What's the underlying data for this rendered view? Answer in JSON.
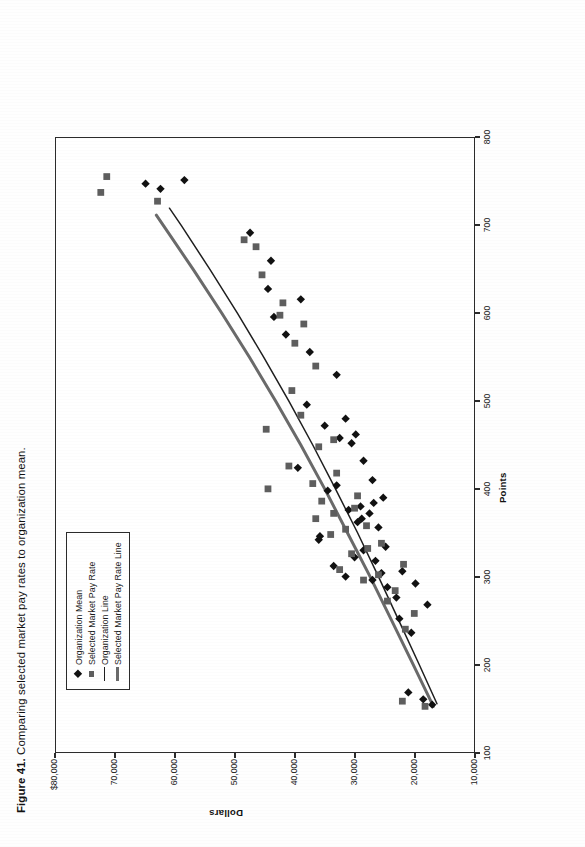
{
  "caption": {
    "figure_number": "Figure 41.",
    "text": "Comparing selected market pay rates to organization mean."
  },
  "legend": {
    "items": [
      {
        "label": "Organization Mean",
        "key": "diamond-marker",
        "color": "#111111"
      },
      {
        "label": "Selected Market Pay Rate",
        "key": "square-marker",
        "color": "#5e5e5e"
      },
      {
        "label": "Organization Line",
        "key": "thin-line",
        "color": "#1f1f1f"
      },
      {
        "label": "Selected Market Pay Rate Line",
        "key": "thick-line",
        "color": "#6a6a6a"
      }
    ]
  },
  "axes": {
    "x_label": "Points",
    "y_label": "Dollars",
    "x_ticks": [
      "100",
      "200",
      "300",
      "400",
      "500",
      "600",
      "700",
      "800"
    ],
    "y_ticks": [
      "$80,000",
      "70,000",
      "60,000",
      "50,000",
      "40,000",
      "30,000",
      "20,000",
      "10,000"
    ]
  },
  "chart_data": {
    "type": "scatter",
    "title": "Comparing selected market pay rates to organization mean.",
    "xlabel": "Points",
    "ylabel": "Dollars",
    "xlim": [
      100,
      800
    ],
    "ylim": [
      10000,
      80000
    ],
    "xticks": [
      100,
      200,
      300,
      400,
      500,
      600,
      700,
      800
    ],
    "yticks": [
      10000,
      20000,
      30000,
      40000,
      50000,
      60000,
      70000,
      80000
    ],
    "grid": false,
    "legend_position": "upper-left",
    "series": [
      {
        "name": "Organization Mean",
        "marker": "diamond",
        "color": "#111111",
        "points": [
          [
            154,
            17000
          ],
          [
            160,
            18500
          ],
          [
            168,
            21000
          ],
          [
            236,
            20500
          ],
          [
            252,
            22500
          ],
          [
            268,
            17800
          ],
          [
            276,
            23000
          ],
          [
            288,
            24500
          ],
          [
            292,
            19800
          ],
          [
            296,
            27000
          ],
          [
            300,
            31500
          ],
          [
            304,
            25500
          ],
          [
            306,
            22000
          ],
          [
            312,
            33500
          ],
          [
            318,
            26500
          ],
          [
            322,
            30000
          ],
          [
            330,
            28500
          ],
          [
            334,
            24800
          ],
          [
            342,
            36000
          ],
          [
            346,
            35800
          ],
          [
            356,
            26000
          ],
          [
            362,
            29500
          ],
          [
            366,
            28800
          ],
          [
            372,
            27500
          ],
          [
            376,
            31000
          ],
          [
            380,
            29000
          ],
          [
            384,
            26800
          ],
          [
            390,
            25200
          ],
          [
            398,
            34500
          ],
          [
            404,
            33000
          ],
          [
            410,
            27000
          ],
          [
            424,
            39500
          ],
          [
            432,
            28500
          ],
          [
            452,
            30500
          ],
          [
            458,
            32500
          ],
          [
            462,
            29800
          ],
          [
            472,
            35000
          ],
          [
            480,
            31500
          ],
          [
            496,
            38000
          ],
          [
            530,
            33000
          ],
          [
            556,
            37500
          ],
          [
            576,
            41500
          ],
          [
            596,
            43500
          ],
          [
            616,
            39000
          ],
          [
            628,
            44500
          ],
          [
            660,
            44000
          ],
          [
            692,
            47500
          ],
          [
            742,
            62500
          ],
          [
            748,
            65000
          ],
          [
            752,
            58500
          ]
        ]
      },
      {
        "name": "Selected Market Pay Rate",
        "marker": "square",
        "color": "#5e5e5e",
        "points": [
          [
            152,
            18200
          ],
          [
            158,
            22000
          ],
          [
            240,
            21500
          ],
          [
            258,
            20000
          ],
          [
            272,
            24500
          ],
          [
            284,
            23200
          ],
          [
            296,
            28500
          ],
          [
            302,
            26000
          ],
          [
            308,
            32500
          ],
          [
            314,
            21800
          ],
          [
            326,
            30500
          ],
          [
            332,
            27800
          ],
          [
            338,
            25500
          ],
          [
            348,
            34000
          ],
          [
            354,
            31500
          ],
          [
            358,
            28000
          ],
          [
            366,
            36500
          ],
          [
            372,
            33500
          ],
          [
            378,
            30000
          ],
          [
            386,
            35500
          ],
          [
            392,
            29500
          ],
          [
            400,
            44500
          ],
          [
            406,
            37000
          ],
          [
            418,
            33000
          ],
          [
            426,
            41000
          ],
          [
            448,
            36000
          ],
          [
            456,
            33500
          ],
          [
            468,
            44800
          ],
          [
            484,
            39000
          ],
          [
            512,
            40500
          ],
          [
            540,
            36500
          ],
          [
            566,
            40000
          ],
          [
            588,
            38500
          ],
          [
            598,
            42500
          ],
          [
            612,
            42000
          ],
          [
            644,
            45500
          ],
          [
            676,
            46500
          ],
          [
            684,
            48500
          ],
          [
            728,
            63000
          ],
          [
            738,
            72500
          ],
          [
            756,
            71500
          ]
        ]
      }
    ],
    "lines": [
      {
        "name": "Organization Line",
        "style": "thin",
        "color": "#1f1f1f",
        "points": [
          [
            155,
            16200
          ],
          [
            200,
            19200
          ],
          [
            250,
            22600
          ],
          [
            300,
            26000
          ],
          [
            350,
            29500
          ],
          [
            400,
            33200
          ],
          [
            450,
            37000
          ],
          [
            500,
            41000
          ],
          [
            550,
            45200
          ],
          [
            600,
            49600
          ],
          [
            650,
            54200
          ],
          [
            700,
            59000
          ],
          [
            720,
            61000
          ]
        ]
      },
      {
        "name": "Selected Market Pay Rate Line",
        "style": "thick",
        "color": "#6a6a6a",
        "points": [
          [
            152,
            16800
          ],
          [
            200,
            20200
          ],
          [
            250,
            23800
          ],
          [
            300,
            27400
          ],
          [
            350,
            31200
          ],
          [
            400,
            35000
          ],
          [
            450,
            39000
          ],
          [
            500,
            43200
          ],
          [
            550,
            47600
          ],
          [
            600,
            52200
          ],
          [
            650,
            57000
          ],
          [
            700,
            62000
          ],
          [
            712,
            63200
          ]
        ]
      }
    ]
  }
}
